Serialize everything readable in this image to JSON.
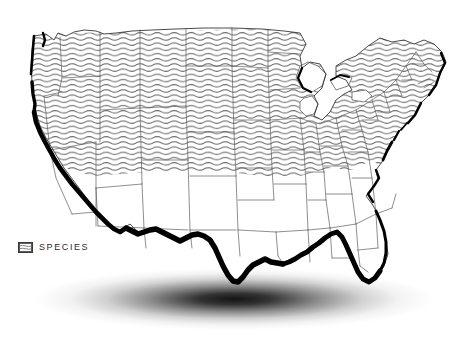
{
  "figure": {
    "kind": "distribution-map",
    "region": "contiguous-united-states",
    "background_color": "#ffffff"
  },
  "legend": {
    "items": [
      {
        "label": "SPECIES",
        "swatch": "wavy-line-hatch",
        "swatch_fill": "#ffffff",
        "swatch_border_color": "#3a3a3a",
        "pattern_color": "#6e6e6e"
      }
    ]
  },
  "styles": {
    "state_border_color": "#5a5a5a",
    "outline_color": "#1a1a1a",
    "emphasis_color": "#000000",
    "hatch_color": "#6e6e6e",
    "land_fill": "#ffffff",
    "water_fill": "#ffffff",
    "shadow_color": "#000000"
  },
  "shaded_states": [
    "Washington",
    "Oregon",
    "Northern California",
    "Idaho",
    "Nevada",
    "Montana",
    "Wyoming",
    "Utah",
    "Colorado",
    "North Dakota",
    "South Dakota",
    "Nebraska",
    "Kansas",
    "Minnesota",
    "Iowa",
    "Missouri",
    "Wisconsin",
    "Illinois",
    "Michigan",
    "Indiana",
    "Ohio",
    "Kentucky",
    "West Virginia",
    "Virginia",
    "Pennsylvania",
    "New York",
    "New Jersey",
    "Maryland",
    "Delaware",
    "Connecticut",
    "Rhode Island",
    "Massachusetts",
    "Vermont",
    "New Hampshire",
    "Maine"
  ],
  "unshaded_states": [
    "Southern California",
    "Arizona",
    "New Mexico",
    "Texas",
    "Oklahoma",
    "Arkansas",
    "Louisiana",
    "Mississippi",
    "Alabama",
    "Tennessee",
    "Georgia",
    "Florida",
    "South Carolina",
    "North Carolina"
  ],
  "emphasized_coastlines": [
    "Pacific Coast",
    "Mexico Border",
    "Gulf Coast",
    "Florida West Coast",
    "Mid-Atlantic Coast",
    "New England Coast"
  ]
}
